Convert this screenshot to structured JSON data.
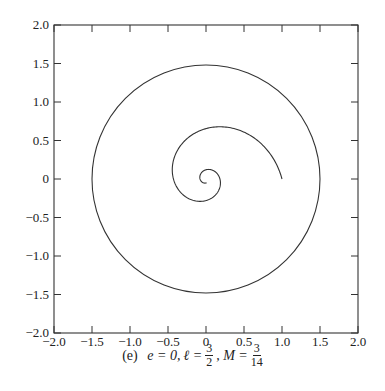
{
  "chart_data": {
    "type": "line",
    "title": "",
    "xlabel": "",
    "ylabel": "",
    "xlim": [
      -2.0,
      2.0
    ],
    "ylim": [
      -2.0,
      2.0
    ],
    "grid": false,
    "x_ticks": [
      "-2.0",
      "-1.5",
      "-1.0",
      "-0.5",
      "0",
      "0.5",
      "1.0",
      "1.5",
      "2.0"
    ],
    "y_ticks": [
      "2.0",
      "1.5",
      "1.0",
      "0.5",
      "0",
      "-0.5",
      "-1.0",
      "-1.5",
      "-2.0"
    ],
    "series": [
      {
        "name": "orbit",
        "description": "Inward spiral starting at (1,0), expanding to outer radius ~1.5 circle, inner turns spiralling to origin near (0.05,0.05)",
        "points": [
          [
            1.0,
            0.0
          ],
          [
            0.97,
            0.35
          ],
          [
            0.8,
            0.7
          ],
          [
            0.5,
            0.93
          ],
          [
            0.1,
            0.98
          ],
          [
            -0.3,
            0.92
          ],
          [
            -0.6,
            0.7
          ],
          [
            -0.75,
            0.35
          ],
          [
            -0.73,
            0.0
          ],
          [
            -0.55,
            -0.4
          ],
          [
            -0.25,
            -0.6
          ],
          [
            0.05,
            -0.6
          ],
          [
            0.3,
            -0.45
          ],
          [
            0.38,
            -0.2
          ],
          [
            0.35,
            0.0
          ],
          [
            0.22,
            0.12
          ],
          [
            0.08,
            0.12
          ],
          [
            0.03,
            0.05
          ]
        ],
        "outer_circle_radius": 1.5
      }
    ]
  },
  "caption": {
    "label": "(e)",
    "e_part": "e = 0,",
    "l_symbol": "ℓ =",
    "l_num": "3",
    "l_den": "2",
    "m_symbol": ", M =",
    "m_num": "3",
    "m_den": "14"
  }
}
